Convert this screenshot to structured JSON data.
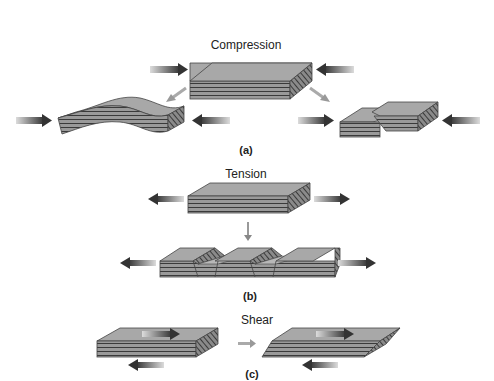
{
  "panels": {
    "a": {
      "title": "Compression",
      "caption": "(a)",
      "outcomes": [
        "folding",
        "faulting"
      ]
    },
    "b": {
      "title": "Tension",
      "caption": "(b)",
      "outcomes": [
        "normal faulting / grabens"
      ]
    },
    "c": {
      "title": "Shear",
      "caption": "(c)",
      "outcomes": [
        "sheared block"
      ]
    }
  },
  "colors": {
    "block_top": "#a8a8a8",
    "block_side": "#8a8a8a",
    "layer_line": "#3a3a3a",
    "arrow_dark": "#3c3c3c",
    "arrow_light": "#9a9a9a",
    "background": "#ffffff"
  }
}
